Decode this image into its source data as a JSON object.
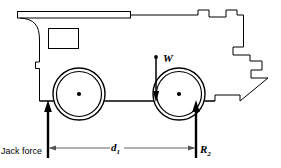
{
  "figure": {
    "kind": "free-body-diagram",
    "stroke_color": "#000000",
    "background_color": "#ffffff"
  },
  "labels": {
    "jack_force": "Jack force",
    "distance_d1": "d",
    "distance_d1_sub": "1",
    "weight": "W",
    "reaction_r2": "R",
    "reaction_r2_sub": "2"
  },
  "geometry": {
    "body_outline_points": "20,12 20,21 131,21 131,15 198,15 198,10 209,10 209,17 226,17 226,10 237,10 237,15 243,15 243,47 233,47 233,55 250,55 250,61 262,61 262,70 251,70 251,78 268,78 240,101 240,95 215,95 215,101 40,101 40,68 36,68 36,62 40,62 40,33 36,21",
    "roof_slab": {
      "x": 17,
      "y": 11,
      "width": 114,
      "height": 7
    },
    "window": {
      "x": 48,
      "y": 28,
      "width": 31,
      "height": 21
    },
    "fillet": {
      "from_x": 20,
      "from_y": 21,
      "to_x": 40,
      "to_y": 40
    },
    "ground_line": {
      "x1": 40,
      "y1": 101,
      "x2": 215,
      "y2": 101
    },
    "wheels": [
      {
        "name": "front-wheel",
        "cx": 79,
        "cy": 94,
        "r_outer": 26,
        "r_inner": 23,
        "hub_r": 2
      },
      {
        "name": "rear-wheel",
        "cx": 179,
        "cy": 94,
        "r_outer": 26,
        "r_inner": 23,
        "hub_r": 2
      }
    ],
    "force_vectors": [
      {
        "name": "jack-force-arrow",
        "x": 48,
        "y_tail": 155,
        "y_head": 101,
        "direction": "up"
      },
      {
        "name": "weight-arrow",
        "x": 156,
        "y_tail": 57,
        "y_head": 101,
        "direction": "down"
      },
      {
        "name": "reaction-r2-arrow",
        "x": 196,
        "y_tail": 155,
        "y_head": 101,
        "direction": "up"
      }
    ],
    "dimension_line": {
      "name": "d1-dimension",
      "y": 148,
      "x_left": 48,
      "x_right": 196,
      "extension_left_x": 48,
      "extension_right_x": 196
    }
  }
}
